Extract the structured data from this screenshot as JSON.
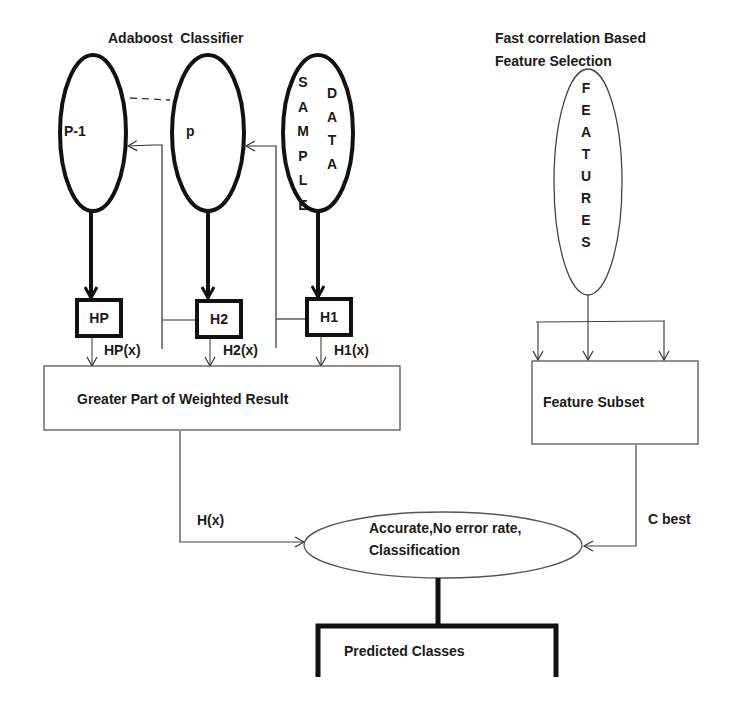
{
  "diagram": {
    "adaboost_title": "Adaboost  Classifier",
    "fcbf_title_line1": "Fast correlation Based",
    "fcbf_title_line2": "Feature Selection",
    "ellipse_p_minus_1": "P-1",
    "ellipse_p": "p",
    "sample_data": {
      "word1": "SAMPLE",
      "word2": "DATA"
    },
    "features": "FEATURES",
    "hyp_boxes": [
      "HP",
      "H2",
      "H1"
    ],
    "hyp_outputs": [
      "HP(x)",
      "H2(x)",
      "H1(x)"
    ],
    "weighted_box": "Greater Part of Weighted Result",
    "feature_subset_box": "Feature Subset",
    "hx_label": "H(x)",
    "cbest_label": "C best",
    "classification_line1": "Accurate,No error rate,",
    "classification_line2": "Classification",
    "predicted_box": "Predicted Classes"
  }
}
